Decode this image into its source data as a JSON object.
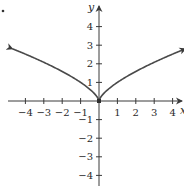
{
  "chart_data": {
    "type": "line",
    "title": "",
    "xlabel": "x",
    "ylabel": "y",
    "xlim": [
      -4.7,
      4.7
    ],
    "ylim": [
      -4.6,
      4.6
    ],
    "grid": false,
    "legend": null,
    "x_ticks": [
      -4,
      -3,
      -2,
      -1,
      1,
      2,
      3,
      4
    ],
    "y_ticks": [
      -4,
      -3,
      -2,
      -1,
      1,
      2,
      3,
      4
    ],
    "x_tick_labels": [
      "−4",
      "−3",
      "−2",
      "−1",
      "1",
      "2",
      "3",
      "4"
    ],
    "y_tick_labels": [
      "−4",
      "−3",
      "−2",
      "−1",
      "1",
      "2",
      "3",
      "4"
    ],
    "series": [
      {
        "name": "y = x^(2/3)",
        "description": "Cusp at origin, symmetric about y-axis, arrows at both ends",
        "x": [
          -4.7,
          -4,
          -3,
          -2,
          -1,
          -0.5,
          -0.1,
          0,
          0.1,
          0.5,
          1,
          2,
          3,
          4,
          4.7
        ],
        "y": [
          2.81,
          2.52,
          2.08,
          1.59,
          1.0,
          0.63,
          0.22,
          0,
          0.22,
          0.63,
          1.0,
          1.59,
          2.08,
          2.52,
          2.81
        ],
        "color": "#4a4a4a",
        "arrows": [
          "left",
          "right"
        ],
        "marked_point": [
          0,
          0
        ]
      }
    ]
  },
  "figure": {
    "corner_mark": "."
  }
}
